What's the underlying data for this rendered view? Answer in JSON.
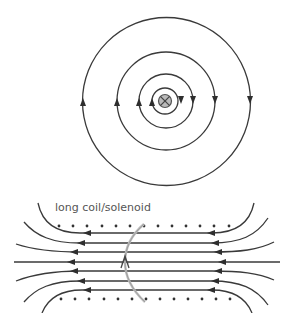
{
  "figure": {
    "top_caption_fragment": "",
    "straight_wire": {
      "center": [
        165,
        101
      ],
      "current_symbol": "cross-into-page",
      "current_symbol_fill": "#bbbbbb",
      "field_line_radii": [
        13,
        27,
        49,
        84
      ],
      "field_direction": "clockwise",
      "arrow_direction_left": "up",
      "arrow_direction_right": "down"
    },
    "solenoid": {
      "label": "long coil/solenoid",
      "top_dots_count": 13,
      "bottom_dots_count": 13,
      "field_line_count": 7,
      "field_direction_inside": "right-to-left",
      "loop_color": "#bdbdbd",
      "loop_arrow_direction": "up"
    }
  }
}
